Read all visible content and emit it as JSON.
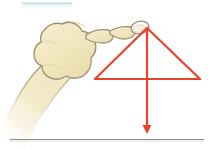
{
  "figure": {
    "background_color": "#ffffff",
    "width": 208,
    "height": 148
  },
  "colors": {
    "skin_fill": "#f2e7c0",
    "skin_fill_light": "#faf4da",
    "skin_outline": "#9b9275",
    "accent_red": "#e8442a",
    "accent_red_light": "#f4806a",
    "rule_gray": "#8a8a8a",
    "rule_blue": "#bfe0e0",
    "white": "#ffffff"
  },
  "elements": {
    "top_rule": {
      "name": "top-divider",
      "color": "#bfe0e0",
      "x1": 22,
      "y1": 3,
      "x2": 72,
      "y2": 3,
      "stroke_width": 2
    },
    "bottom_rule": {
      "name": "bottom-divider",
      "color": "#8a8a8a",
      "x1": 10,
      "y1": 140,
      "x2": 204,
      "y2": 140,
      "stroke_width": 1.2
    },
    "hand": {
      "name": "pointing-hand",
      "description": "Left hand, fist closed, index finger extended pointing right toward triangle apex",
      "fill": "#f2e7c0",
      "outline": "#9b9275",
      "fingertip_x": 146,
      "fingertip_y": 25
    },
    "triangle": {
      "name": "red-triangle",
      "stroke": "#e8442a",
      "stroke_width": 2.2,
      "apex": {
        "x": 147,
        "y": 28
      },
      "base_left": {
        "x": 95,
        "y": 79
      },
      "base_right": {
        "x": 200,
        "y": 79
      }
    },
    "arrow": {
      "name": "downward-arrow",
      "stroke": "#e8442a",
      "stroke_width": 2.2,
      "tail": {
        "x": 147,
        "y": 28
      },
      "tip": {
        "x": 147,
        "y": 134
      },
      "head_width": 9,
      "head_length": 9,
      "direction": "down"
    }
  },
  "labels": {
    "caption": ""
  }
}
